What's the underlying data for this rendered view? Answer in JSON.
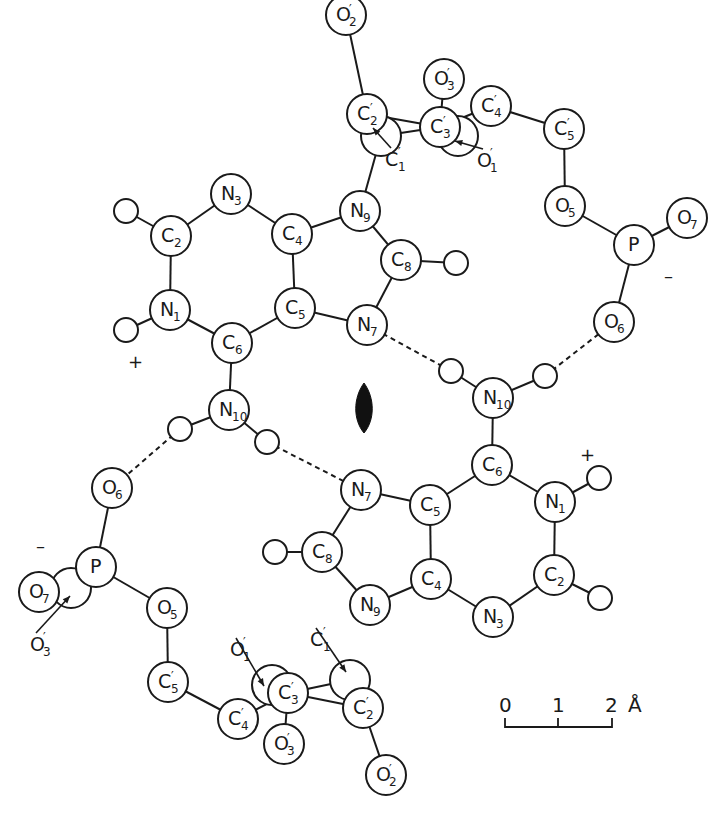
{
  "figure": {
    "twofold_axis_symbol": "filled-lens",
    "scale_bar": {
      "ticks": [
        "0",
        "1",
        "2"
      ],
      "unit": "Å"
    },
    "charges": {
      "upper_plus": "+",
      "upper_minus": "–",
      "lower_plus": "+",
      "lower_minus": "–"
    }
  },
  "molecules": [
    {
      "name": "molecule-upper",
      "atoms": [
        {
          "id": "O2p",
          "el": "O",
          "sub": "2",
          "prime": true,
          "x": 346,
          "y": 15,
          "r": 20
        },
        {
          "id": "C2p",
          "el": "C",
          "sub": "2",
          "prime": true,
          "x": 367,
          "y": 114,
          "r": 20
        },
        {
          "id": "C1p",
          "el": "C",
          "sub": "",
          "prime": false,
          "x": 381,
          "y": 136,
          "r": 20,
          "hidden": true
        },
        {
          "id": "C3p",
          "el": "C",
          "sub": "3",
          "prime": true,
          "x": 440,
          "y": 127,
          "r": 20
        },
        {
          "id": "O1p",
          "el": "O",
          "sub": "",
          "prime": false,
          "x": 458,
          "y": 136,
          "r": 20,
          "hidden": true
        },
        {
          "id": "O3p",
          "el": "O",
          "sub": "3",
          "prime": true,
          "x": 444,
          "y": 79,
          "r": 20
        },
        {
          "id": "C4p",
          "el": "C",
          "sub": "4",
          "prime": true,
          "x": 491,
          "y": 106,
          "r": 20
        },
        {
          "id": "C5p",
          "el": "C",
          "sub": "5",
          "prime": true,
          "x": 564,
          "y": 129,
          "r": 20
        },
        {
          "id": "O5",
          "el": "O",
          "sub": "5",
          "prime": false,
          "x": 565,
          "y": 206,
          "r": 20
        },
        {
          "id": "P",
          "el": "P",
          "sub": "",
          "prime": false,
          "x": 634,
          "y": 245,
          "r": 20
        },
        {
          "id": "O7",
          "el": "O",
          "sub": "7",
          "prime": false,
          "x": 687,
          "y": 218,
          "r": 20
        },
        {
          "id": "O6",
          "el": "O",
          "sub": "6",
          "prime": false,
          "x": 614,
          "y": 322,
          "r": 20
        },
        {
          "id": "N9",
          "el": "N",
          "sub": "9",
          "prime": false,
          "x": 360,
          "y": 211,
          "r": 20
        },
        {
          "id": "C8",
          "el": "C",
          "sub": "8",
          "prime": false,
          "x": 401,
          "y": 260,
          "r": 20
        },
        {
          "id": "N7",
          "el": "N",
          "sub": "7",
          "prime": false,
          "x": 367,
          "y": 325,
          "r": 20
        },
        {
          "id": "C4",
          "el": "C",
          "sub": "4",
          "prime": false,
          "x": 292,
          "y": 234,
          "r": 20
        },
        {
          "id": "C5",
          "el": "C",
          "sub": "5",
          "prime": false,
          "x": 295,
          "y": 308,
          "r": 20
        },
        {
          "id": "N3",
          "el": "N",
          "sub": "3",
          "prime": false,
          "x": 231,
          "y": 194,
          "r": 20
        },
        {
          "id": "C2",
          "el": "C",
          "sub": "2",
          "prime": false,
          "x": 171,
          "y": 236,
          "r": 20
        },
        {
          "id": "N1",
          "el": "N",
          "sub": "1",
          "prime": false,
          "x": 170,
          "y": 310,
          "r": 20
        },
        {
          "id": "C6",
          "el": "C",
          "sub": "6",
          "prime": false,
          "x": 232,
          "y": 343,
          "r": 20
        },
        {
          "id": "N10",
          "el": "N",
          "sub": "10",
          "prime": false,
          "x": 229,
          "y": 410,
          "r": 20
        }
      ]
    },
    {
      "name": "molecule-lower",
      "atoms": [
        {
          "id": "N10",
          "el": "N",
          "sub": "10",
          "prime": false,
          "x": 493,
          "y": 398,
          "r": 20
        },
        {
          "id": "C6",
          "el": "C",
          "sub": "6",
          "prime": false,
          "x": 492,
          "y": 465,
          "r": 20
        },
        {
          "id": "N1",
          "el": "N",
          "sub": "1",
          "prime": false,
          "x": 555,
          "y": 502,
          "r": 20
        },
        {
          "id": "C2",
          "el": "C",
          "sub": "2",
          "prime": false,
          "x": 554,
          "y": 575,
          "r": 20
        },
        {
          "id": "N3",
          "el": "N",
          "sub": "3",
          "prime": false,
          "x": 493,
          "y": 617,
          "r": 20
        },
        {
          "id": "C4",
          "el": "C",
          "sub": "4",
          "prime": false,
          "x": 431,
          "y": 579,
          "r": 20
        },
        {
          "id": "C5",
          "el": "C",
          "sub": "5",
          "prime": false,
          "x": 430,
          "y": 505,
          "r": 20
        },
        {
          "id": "N7",
          "el": "N",
          "sub": "7",
          "prime": false,
          "x": 361,
          "y": 490,
          "r": 20
        },
        {
          "id": "C8",
          "el": "C",
          "sub": "8",
          "prime": false,
          "x": 322,
          "y": 552,
          "r": 20
        },
        {
          "id": "N9",
          "el": "N",
          "sub": "9",
          "prime": false,
          "x": 370,
          "y": 605,
          "r": 20
        },
        {
          "id": "O6",
          "el": "O",
          "sub": "6",
          "prime": false,
          "x": 112,
          "y": 488,
          "r": 20
        },
        {
          "id": "P",
          "el": "P",
          "sub": "",
          "prime": false,
          "x": 96,
          "y": 567,
          "r": 20
        },
        {
          "id": "O3p_back",
          "el": "O",
          "sub": "",
          "prime": false,
          "x": 71,
          "y": 588,
          "r": 20,
          "hidden": true
        },
        {
          "id": "O7",
          "el": "O",
          "sub": "7",
          "prime": false,
          "x": 39,
          "y": 592,
          "r": 20
        },
        {
          "id": "O5",
          "el": "O",
          "sub": "5",
          "prime": false,
          "x": 167,
          "y": 608,
          "r": 20
        },
        {
          "id": "C5p",
          "el": "C",
          "sub": "5",
          "prime": true,
          "x": 168,
          "y": 682,
          "r": 20
        },
        {
          "id": "C4p",
          "el": "C",
          "sub": "4",
          "prime": true,
          "x": 238,
          "y": 719,
          "r": 20
        },
        {
          "id": "O1p_back",
          "el": "O",
          "sub": "",
          "prime": false,
          "x": 272,
          "y": 685,
          "r": 20,
          "hidden": true
        },
        {
          "id": "C3p",
          "el": "C",
          "sub": "3",
          "prime": true,
          "x": 288,
          "y": 693,
          "r": 20
        },
        {
          "id": "O3p",
          "el": "O",
          "sub": "3",
          "prime": true,
          "x": 284,
          "y": 744,
          "r": 20
        },
        {
          "id": "C1p_back",
          "el": "C",
          "sub": "",
          "prime": false,
          "x": 350,
          "y": 680,
          "r": 20,
          "hidden": true
        },
        {
          "id": "C2p",
          "el": "C",
          "sub": "2",
          "prime": true,
          "x": 363,
          "y": 708,
          "r": 20
        },
        {
          "id": "O2p",
          "el": "O",
          "sub": "2",
          "prime": true,
          "x": 386,
          "y": 775,
          "r": 20
        }
      ]
    }
  ],
  "callouts": [
    {
      "text_el": "C",
      "text_sub": "1",
      "prime": true,
      "x": 395,
      "y": 160,
      "arrow_to": [
        373,
        128
      ]
    },
    {
      "text_el": "O",
      "text_sub": "1",
      "prime": true,
      "x": 487,
      "y": 161,
      "arrow_to": [
        455,
        141
      ]
    },
    {
      "text_el": "O",
      "text_sub": "3",
      "prime": true,
      "x": 40,
      "y": 645,
      "arrow_to": [
        70,
        596
      ]
    },
    {
      "text_el": "O",
      "text_sub": "1",
      "prime": true,
      "x": 240,
      "y": 650,
      "arrow_to": [
        264,
        686
      ]
    },
    {
      "text_el": "C",
      "text_sub": "1",
      "prime": true,
      "x": 320,
      "y": 640,
      "arrow_to": [
        346,
        672
      ]
    }
  ],
  "hydrogens": [
    {
      "x": 126,
      "y": 211
    },
    {
      "x": 126,
      "y": 330
    },
    {
      "x": 456,
      "y": 263
    },
    {
      "x": 451,
      "y": 371
    },
    {
      "x": 545,
      "y": 376
    },
    {
      "x": 180,
      "y": 429
    },
    {
      "x": 267,
      "y": 442
    },
    {
      "x": 599,
      "y": 478
    },
    {
      "x": 600,
      "y": 598
    },
    {
      "x": 275,
      "y": 552
    }
  ]
}
